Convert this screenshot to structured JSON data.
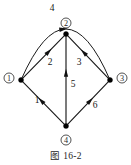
{
  "figure": {
    "caption": "图  16-2",
    "caption_prefix": "图",
    "caption_number": "16-2",
    "type": "directed-graph-diagram",
    "background_color": "#ffffff",
    "ink_color": "#111111"
  },
  "graph": {
    "node_count": 4,
    "edge_count": 6,
    "nodes": [
      {
        "id": "1",
        "label": "①",
        "plain": "1",
        "x": 21,
        "y": 80,
        "label_x": 9,
        "label_y": 78,
        "label_position": "left"
      },
      {
        "id": "2",
        "label": "②",
        "plain": "2",
        "x": 66,
        "y": 34,
        "label_x": 66,
        "label_y": 23,
        "label_position": "above"
      },
      {
        "id": "3",
        "label": "③",
        "plain": "3",
        "x": 110,
        "y": 80,
        "label_x": 122,
        "label_y": 78,
        "label_position": "right"
      },
      {
        "id": "4",
        "label": "④",
        "plain": "4",
        "x": 66,
        "y": 126,
        "label_x": 66,
        "label_y": 140,
        "label_position": "below"
      }
    ],
    "edges": [
      {
        "id": "e1",
        "label": "1",
        "from": "4",
        "to": "1",
        "shape": "line",
        "label_x": 37,
        "label_y": 100,
        "arrow_t": 0.55,
        "direction": "up-left"
      },
      {
        "id": "e2",
        "label": "2",
        "from": "1",
        "to": "2",
        "shape": "line",
        "label_x": 50,
        "label_y": 62,
        "arrow_t": 0.62,
        "direction": "up-right"
      },
      {
        "id": "e3",
        "label": "3",
        "from": "3",
        "to": "2",
        "shape": "line",
        "label_x": 79,
        "label_y": 62,
        "arrow_t": 0.6,
        "direction": "up-left"
      },
      {
        "id": "e4",
        "label": "4",
        "from": "1",
        "to": "3",
        "shape": "arc",
        "label_x": 52,
        "label_y": 8,
        "arrow_t": 0.47,
        "direction": "right-over-top",
        "arc_control_x": 66,
        "arc_control_y": -22
      },
      {
        "id": "e5",
        "label": "5",
        "from": "4",
        "to": "2",
        "shape": "line",
        "label_x": 73,
        "label_y": 84,
        "arrow_t": 0.58,
        "direction": "up"
      },
      {
        "id": "e6",
        "label": "6",
        "from": "4",
        "to": "3",
        "shape": "line",
        "label_x": 95,
        "label_y": 105,
        "arrow_t": 0.55,
        "direction": "up-right"
      }
    ]
  }
}
